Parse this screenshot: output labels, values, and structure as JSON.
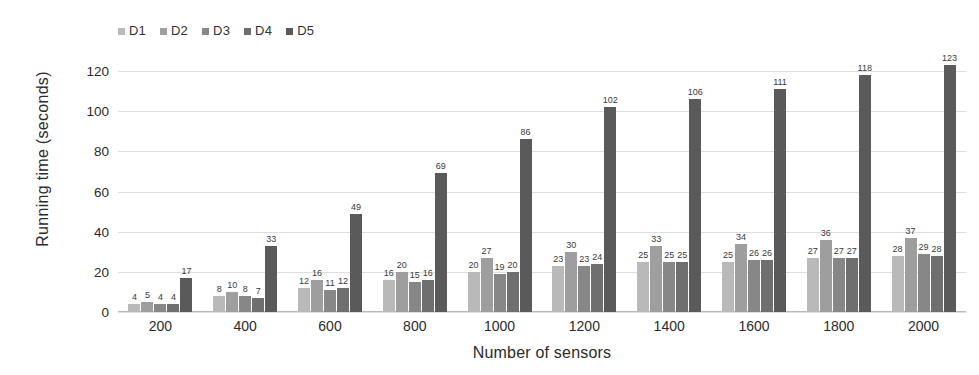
{
  "chart_data": {
    "type": "bar",
    "title": "",
    "xlabel": "Number of sensors",
    "ylabel": "Running time  (seconds)",
    "ylim": [
      0,
      130
    ],
    "yticks": [
      0,
      20,
      40,
      60,
      80,
      100,
      120
    ],
    "grid": true,
    "legend_position": "top-left",
    "categories": [
      "200",
      "400",
      "600",
      "800",
      "1000",
      "1200",
      "1400",
      "1600",
      "1800",
      "2000"
    ],
    "series": [
      {
        "name": "D1",
        "color": "#b9b9b9",
        "values": [
          4,
          8,
          12,
          16,
          20,
          23,
          25,
          25,
          27,
          28
        ]
      },
      {
        "name": "D2",
        "color": "#9e9e9e",
        "values": [
          5,
          10,
          16,
          20,
          27,
          30,
          33,
          34,
          36,
          37
        ]
      },
      {
        "name": "D3",
        "color": "#878787",
        "values": [
          4,
          8,
          11,
          15,
          19,
          23,
          25,
          26,
          27,
          29
        ]
      },
      {
        "name": "D4",
        "color": "#6f6f6f",
        "values": [
          4,
          7,
          12,
          16,
          20,
          24,
          25,
          26,
          27,
          28
        ]
      },
      {
        "name": "D5",
        "color": "#5a5a5a",
        "values": [
          17,
          33,
          49,
          69,
          86,
          102,
          106,
          111,
          118,
          123
        ]
      }
    ]
  }
}
